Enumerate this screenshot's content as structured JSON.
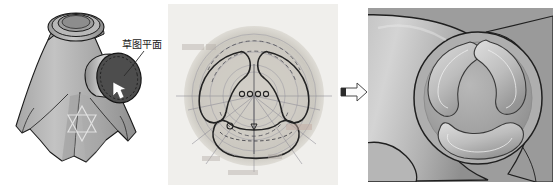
{
  "figure": {
    "background_color": "#ffffff"
  },
  "panels": [
    {
      "id": "left",
      "name": "3d-model-with-callout",
      "background_color": "#ffffff",
      "callout": {
        "label": "草图平面",
        "label_color": "#1a1a1a"
      },
      "colors": {
        "body_light": "#b9b9b9",
        "body_mid": "#a0a0a0",
        "body_dark": "#8a8a8a",
        "boss_face": "#4a4a4a",
        "outline": "#1a1a1a",
        "star": "#e2e2e2",
        "cursor": "#ffffff"
      }
    },
    {
      "id": "middle",
      "name": "sketch-view",
      "background_color": "#f0efec",
      "colors": {
        "disc_outer": "#dedbd4",
        "disc_inner": "#cfccc4",
        "sketch_line": "#2b2b2b",
        "construction_line": "#8e8e96",
        "dashed_line": "#55555c",
        "faint_text": "#b0a9a4",
        "dim_text": "#c0a8a0"
      },
      "slot_count": 3,
      "center_dots": 4
    },
    {
      "id": "arrow",
      "name": "transition-arrow",
      "direction": "right",
      "colors": {
        "fill": "#fbfbfb",
        "stroke": "#4a4a4a",
        "tail_block": "#2a2a2a"
      }
    },
    {
      "id": "right",
      "name": "closeup-render",
      "background_color": "#9d9d9d",
      "colors": {
        "body_light": "#cfcfcf",
        "body_mid": "#b4b4b4",
        "body_dark": "#8f8f8f",
        "boss_face": "#a8a8a8",
        "pocket_light": "#d8d8d8",
        "pocket_dark": "#949494",
        "outline": "#1f1f1f"
      },
      "pocket_count": 3
    }
  ]
}
